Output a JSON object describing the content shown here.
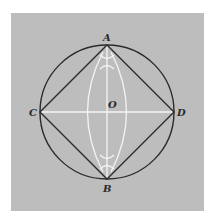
{
  "diagram": {
    "colors": {
      "background": "#ffffff",
      "panel": "#bdbdbd",
      "circle": "#2b2b2b",
      "square": "#2b2b2b",
      "construction": "#f4f4f4",
      "label": "#2a2a2a"
    },
    "circle": {
      "cx": 107,
      "cy": 112,
      "r": 67
    },
    "points": {
      "A": {
        "label": "A",
        "x": 107,
        "y": 45
      },
      "B": {
        "label": "B",
        "x": 107,
        "y": 179
      },
      "C": {
        "label": "C",
        "x": 40,
        "y": 112
      },
      "D": {
        "label": "D",
        "x": 174,
        "y": 112
      },
      "O": {
        "label": "O",
        "x": 107,
        "y": 112
      }
    },
    "labels": {
      "A": "A",
      "B": "B",
      "C": "C",
      "D": "D",
      "O": "O"
    }
  }
}
